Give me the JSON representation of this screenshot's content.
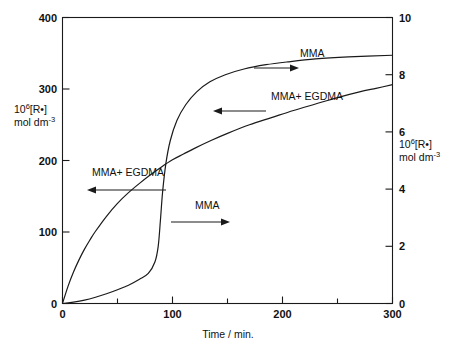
{
  "chart_data": {
    "type": "line",
    "title": "",
    "xlabel": "Time / min.",
    "ylabel_left_line1": "10",
    "ylabel_left_sup": "6",
    "ylabel_left_line1b": "[R•]",
    "ylabel_left_line2": "mol dm",
    "ylabel_left_line2_sup": "-3",
    "ylabel_right_line1": "10",
    "ylabel_right_sup": "6",
    "ylabel_right_line1b": "[R•]",
    "ylabel_right_line2": "mol dm",
    "ylabel_right_line2_sup": "-3",
    "xlim": [
      0,
      300
    ],
    "ylim_left": [
      0,
      400
    ],
    "ylim_right": [
      0,
      10
    ],
    "xticks": [
      0,
      100,
      200,
      300
    ],
    "xtick_labels": [
      "0",
      "100",
      "200",
      "300"
    ],
    "xminor_ticks": [
      50,
      150,
      250
    ],
    "yticks_left": [
      0,
      100,
      200,
      300,
      400
    ],
    "ytick_labels_left": [
      "0",
      "100",
      "200",
      "300",
      "400"
    ],
    "yticks_right": [
      0,
      2,
      4,
      6,
      8,
      10
    ],
    "ytick_labels_right": [
      "0",
      "2",
      "4",
      "6",
      "8",
      "10"
    ],
    "grid": false,
    "legend": "annotations-with-arrows",
    "series": [
      {
        "name": "MMA+ EGDMA",
        "axis": "left",
        "x": [
          0,
          5,
          10,
          15,
          20,
          25,
          30,
          40,
          50,
          60,
          70,
          80,
          90,
          100,
          110,
          120,
          135,
          150,
          170,
          190,
          210,
          230,
          250,
          270,
          285,
          300
        ],
        "y": [
          0,
          24,
          44,
          61,
          76,
          89,
          101,
          122,
          140,
          155,
          168,
          180,
          191,
          201,
          209,
          217,
          228,
          238,
          250,
          260,
          270,
          279,
          288,
          296,
          301,
          306
        ]
      },
      {
        "name": "MMA",
        "axis": "right",
        "x": [
          0,
          10,
          20,
          30,
          40,
          50,
          60,
          70,
          78,
          84,
          87,
          89,
          91,
          94,
          98,
          104,
          112,
          122,
          134,
          148,
          165,
          185,
          205,
          230,
          260,
          300
        ],
        "y": [
          0.0,
          0.05,
          0.12,
          0.22,
          0.34,
          0.48,
          0.64,
          0.85,
          1.05,
          1.45,
          2.0,
          2.9,
          3.9,
          4.9,
          5.7,
          6.4,
          6.95,
          7.4,
          7.75,
          8.0,
          8.2,
          8.35,
          8.45,
          8.55,
          8.62,
          8.68
        ]
      }
    ],
    "annotations": [
      {
        "name": "mma-top-right",
        "text": "MMA",
        "direction": "right",
        "text_x": 300,
        "text_y": 57,
        "arrow_x1": 254,
        "arrow_x2": 296,
        "arrow_y": 68
      },
      {
        "name": "mma-egdma-right",
        "text": "MMA+ EGDMA",
        "direction": "left",
        "text_x": 271,
        "text_y": 100,
        "arrow_x1": 266,
        "arrow_x2": 213,
        "arrow_y": 111
      },
      {
        "name": "mma-egdma-left",
        "text": "MMA+ EGDMA",
        "direction": "left",
        "text_x": 128,
        "text_y": 176,
        "arrow_x1": 166,
        "arrow_x2": 87,
        "arrow_y": 190
      },
      {
        "name": "mma-center",
        "text": "MMA",
        "direction": "right",
        "text_x": 195,
        "text_y": 209,
        "arrow_x1": 171,
        "arrow_x2": 230,
        "arrow_y": 222
      }
    ]
  },
  "axis_labels": {
    "x_title": "Time / min.",
    "left_unit_base": "10",
    "left_unit_exp": "6",
    "left_unit_species": "[R•]",
    "left_unit_denom": "mol dm",
    "left_unit_denom_exp": "-3",
    "right_unit_base": "10",
    "right_unit_exp": "6",
    "right_unit_species": "[R•]",
    "right_unit_denom": "mol dm",
    "right_unit_denom_exp": "-3"
  },
  "colors": {
    "background": "#ffffff",
    "ink": "#1a1a1a",
    "curve": "#1a1a1a"
  }
}
